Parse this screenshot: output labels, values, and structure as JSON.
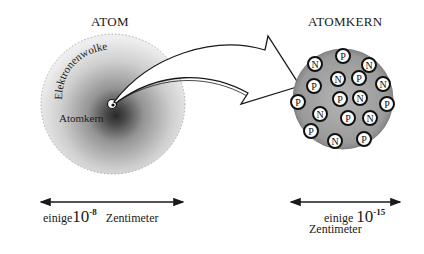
{
  "atom": {
    "title": "ATOM",
    "cloud_label": "Elektronenwolke",
    "nucleus_label": "Atomkern",
    "scale": {
      "prefix": "einige",
      "base": "10",
      "exponent": "-8",
      "unit": "Zentimeter"
    }
  },
  "nucleus": {
    "title": "ATOMKERN",
    "particles": [
      {
        "type": "P",
        "x": 343,
        "y": 56
      },
      {
        "type": "N",
        "x": 315,
        "y": 64
      },
      {
        "type": "N",
        "x": 369,
        "y": 65
      },
      {
        "type": "P",
        "x": 314,
        "y": 86
      },
      {
        "type": "N",
        "x": 338,
        "y": 79
      },
      {
        "type": "P",
        "x": 359,
        "y": 78
      },
      {
        "type": "N",
        "x": 383,
        "y": 84
      },
      {
        "type": "P",
        "x": 298,
        "y": 102
      },
      {
        "type": "P",
        "x": 340,
        "y": 99
      },
      {
        "type": "N",
        "x": 360,
        "y": 98
      },
      {
        "type": "P",
        "x": 387,
        "y": 104
      },
      {
        "type": "N",
        "x": 320,
        "y": 114
      },
      {
        "type": "P",
        "x": 348,
        "y": 118
      },
      {
        "type": "N",
        "x": 370,
        "y": 118
      },
      {
        "type": "P",
        "x": 311,
        "y": 131
      },
      {
        "type": "N",
        "x": 335,
        "y": 141
      },
      {
        "type": "P",
        "x": 364,
        "y": 139
      }
    ],
    "scale": {
      "prefix": "einige",
      "base": "10",
      "exponent": "-15",
      "unit": "Zentimeter"
    }
  },
  "colors": {
    "ink": "#1a1a1a",
    "paper": "#ffffff",
    "stipple": "#8a8a8a"
  }
}
